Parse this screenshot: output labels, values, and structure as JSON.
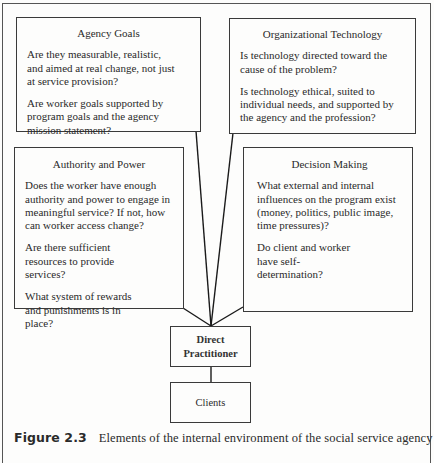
{
  "figure": {
    "label": "Figure 2.3",
    "caption": "Elements of the internal environment of the social service agency"
  },
  "boxes": {
    "agency_goals": {
      "title": "Agency Goals",
      "paragraphs": [
        "Are they measurable, realistic, and aimed at real change, not just at service provision?",
        "Are worker goals supported by program goals and the agency mission statement?"
      ]
    },
    "organizational_technology": {
      "title": "Organizational Technology",
      "paragraphs": [
        "Is technology directed toward the cause of the problem?",
        "Is technology ethical, suited to individual needs, and supported by the agency and the profession?"
      ]
    },
    "authority_and_power": {
      "title": "Authority and Power",
      "paragraphs": [
        "Does the worker have enough authority and power to engage in meaningful service? If not, how can worker access change?",
        "Are there sufficient resources to provide services?",
        "What system of rewards and punishments is in place?"
      ]
    },
    "decision_making": {
      "title": "Decision Making",
      "paragraphs": [
        "What external and internal influences on the program exist (money, politics, public image, time pressures)?",
        "Do client and worker have self-determination?"
      ]
    },
    "direct_practitioner": {
      "title": "Direct Practitioner"
    },
    "clients": {
      "title": "Clients"
    }
  },
  "colors": {
    "line": "#1a1a1a",
    "border": "#3a3a3a",
    "background": "#fdfdfc"
  }
}
